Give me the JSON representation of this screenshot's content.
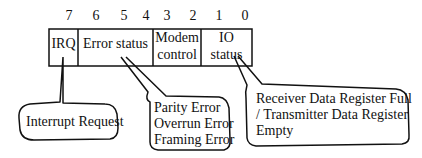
{
  "diagram": {
    "bit_numbers": [
      "7",
      "6",
      "5",
      "4",
      "3",
      "2",
      "1",
      "0"
    ],
    "fields": [
      {
        "label": "IRQ",
        "bits": "7"
      },
      {
        "label": "Error status",
        "bits": "6-4"
      },
      {
        "label_line1": "Modem",
        "label_line2": "control",
        "bits": "3-2"
      },
      {
        "label_line1": "IO",
        "label_line2": "status",
        "bits": "1-0"
      }
    ],
    "callouts": {
      "irq": {
        "text": "Interrupt Request"
      },
      "error": {
        "line1": "Parity Error",
        "line2": "Overrun Error",
        "line3": "Framing Error"
      },
      "io": {
        "line1": "Receiver Data Register Full",
        "line2": "/ Transmitter Data Register",
        "line3": "Empty"
      }
    },
    "colors": {
      "line": "#111111",
      "background": "#ffffff"
    }
  }
}
